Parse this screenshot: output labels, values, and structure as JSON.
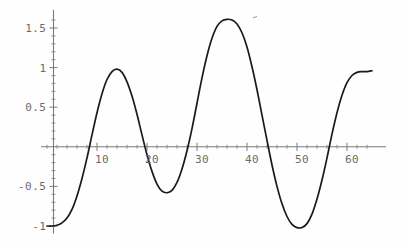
{
  "chart_data": {
    "type": "line",
    "title": "",
    "xlabel": "",
    "ylabel": "",
    "xlim": [
      0,
      65
    ],
    "ylim": [
      -1.12,
      1.68
    ],
    "grid": false,
    "legend": null,
    "axis_color": "#7a7a7a",
    "curve_color": "#1a1a1a",
    "x_ticks_major": [
      10,
      20,
      30,
      40,
      50,
      60
    ],
    "x_tick_labels": [
      "10",
      "20",
      "30",
      "40",
      "50",
      "60"
    ],
    "y_ticks_major": [
      -1,
      -0.5,
      0.5,
      1,
      1.5
    ],
    "y_tick_labels": [
      "-1",
      "-0.5",
      "0.5",
      "1",
      "1.5"
    ],
    "x_minor_step": 2,
    "y_minor_step": 0.1,
    "series": [
      {
        "name": "beat-wave",
        "description": "amplitude-modulated oscillation, starts at -1",
        "points": [
          [
            0,
            -1.0
          ],
          [
            1,
            -1.0
          ],
          [
            2,
            -0.99
          ],
          [
            3,
            -0.96
          ],
          [
            4,
            -0.9
          ],
          [
            5,
            -0.79
          ],
          [
            6,
            -0.62
          ],
          [
            7,
            -0.4
          ],
          [
            8,
            -0.14
          ],
          [
            9,
            0.15
          ],
          [
            10,
            0.43
          ],
          [
            11,
            0.67
          ],
          [
            12,
            0.85
          ],
          [
            13,
            0.95
          ],
          [
            14,
            0.98
          ],
          [
            15,
            0.94
          ],
          [
            16,
            0.82
          ],
          [
            17,
            0.64
          ],
          [
            18,
            0.41
          ],
          [
            19,
            0.15
          ],
          [
            20,
            -0.1
          ],
          [
            21,
            -0.31
          ],
          [
            22,
            -0.47
          ],
          [
            23,
            -0.56
          ],
          [
            24,
            -0.58
          ],
          [
            25,
            -0.55
          ],
          [
            26,
            -0.45
          ],
          [
            27,
            -0.28
          ],
          [
            28,
            -0.05
          ],
          [
            29,
            0.23
          ],
          [
            30,
            0.55
          ],
          [
            31,
            0.87
          ],
          [
            32,
            1.15
          ],
          [
            33,
            1.37
          ],
          [
            34,
            1.52
          ],
          [
            35,
            1.59
          ],
          [
            36,
            1.61
          ],
          [
            37,
            1.6
          ],
          [
            38,
            1.55
          ],
          [
            39,
            1.44
          ],
          [
            40,
            1.26
          ],
          [
            41,
            1.01
          ],
          [
            42,
            0.72
          ],
          [
            43,
            0.4
          ],
          [
            44,
            0.08
          ],
          [
            45,
            -0.23
          ],
          [
            46,
            -0.5
          ],
          [
            47,
            -0.72
          ],
          [
            48,
            -0.88
          ],
          [
            49,
            -0.98
          ],
          [
            50,
            -1.02
          ],
          [
            51,
            -1.02
          ],
          [
            52,
            -0.97
          ],
          [
            53,
            -0.85
          ],
          [
            54,
            -0.66
          ],
          [
            55,
            -0.42
          ],
          [
            56,
            -0.14
          ],
          [
            57,
            0.16
          ],
          [
            58,
            0.43
          ],
          [
            59,
            0.65
          ],
          [
            60,
            0.81
          ],
          [
            61,
            0.9
          ],
          [
            62,
            0.94
          ],
          [
            63,
            0.95
          ],
          [
            64,
            0.95
          ],
          [
            65,
            0.96
          ]
        ]
      }
    ],
    "annotations": [
      {
        "label": "peak-1",
        "x": 14,
        "y": 0.98
      },
      {
        "label": "trough-1",
        "x": 24.5,
        "y": -0.57
      },
      {
        "label": "peak-2",
        "x": 36.5,
        "y": 1.61
      },
      {
        "label": "trough-2",
        "x": 50.5,
        "y": -1.02
      },
      {
        "label": "peak-3",
        "x": 64,
        "y": 0.95
      }
    ]
  }
}
